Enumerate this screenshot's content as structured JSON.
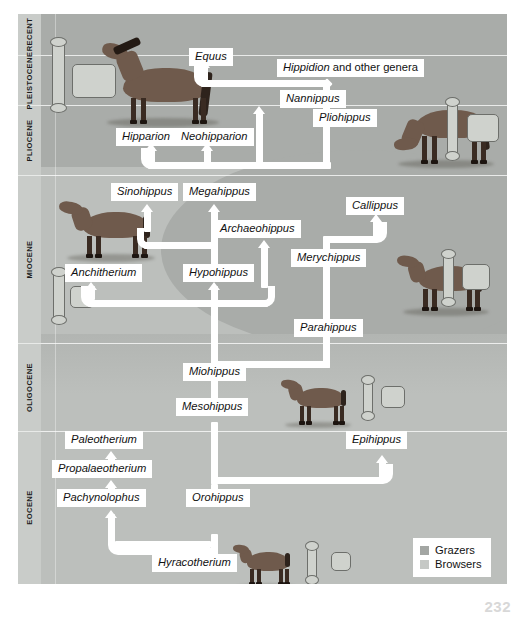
{
  "figure": {
    "kind": "horse-evolution-phylogeny-chart",
    "page_number": "232"
  },
  "epochs": [
    {
      "name": "RECENT",
      "top": 0,
      "height": 41
    },
    {
      "name": "PLEISTOCENE",
      "top": 41,
      "height": 50
    },
    {
      "name": "PLIOCENE",
      "top": 91,
      "height": 70
    },
    {
      "name": "MIOCENE",
      "top": 161,
      "height": 168
    },
    {
      "name": "OLIGOCENE",
      "top": 329,
      "height": 88
    },
    {
      "name": "EOCENE",
      "top": 417,
      "height": 153
    }
  ],
  "taxa": [
    {
      "id": "equus",
      "label": "Equus",
      "x": 148,
      "y": 44,
      "italic": true
    },
    {
      "id": "hippidion",
      "label": "Hippidion",
      "suffix": " and other genera",
      "x": 236,
      "y": 55,
      "italic": true
    },
    {
      "id": "nannippus",
      "label": "Nannippus",
      "x": 239,
      "y": 86,
      "italic": true
    },
    {
      "id": "pliohippus",
      "label": "Pliohippus",
      "x": 272,
      "y": 105,
      "italic": true
    },
    {
      "id": "hipparion",
      "label": "Hipparion",
      "x": 139,
      "y": 124,
      "italic": true
    },
    {
      "id": "neohipparion",
      "label": "Neohipparion",
      "x": 191,
      "y": 124,
      "italic": true
    },
    {
      "id": "sinohippus",
      "label": "Sinohippus",
      "x": 78,
      "y": 179,
      "italic": true
    },
    {
      "id": "megahippus",
      "label": "Megahippus",
      "x": 155,
      "y": 179,
      "italic": true
    },
    {
      "id": "archaeohippus",
      "label": "Archaeohippus",
      "x": 190,
      "y": 217,
      "italic": true
    },
    {
      "id": "callippus",
      "label": "Callippus",
      "x": 330,
      "y": 192,
      "italic": true
    },
    {
      "id": "merychippus",
      "label": "Merychippus",
      "x": 269,
      "y": 246,
      "italic": true
    },
    {
      "id": "anchitherium",
      "label": "Anchitherium",
      "x": 32,
      "y": 260,
      "italic": true
    },
    {
      "id": "hypohippus",
      "label": "Hypohippus",
      "x": 155,
      "y": 260,
      "italic": true
    },
    {
      "id": "parahippus",
      "label": "Parahippus",
      "x": 272,
      "y": 315,
      "italic": true
    },
    {
      "id": "miohippus",
      "label": "Miohippus",
      "x": 155,
      "y": 360,
      "italic": true
    },
    {
      "id": "mesohippus",
      "label": "Mesohippus",
      "x": 148,
      "y": 395,
      "italic": true
    },
    {
      "id": "paleotherium",
      "label": "Paleotherium",
      "x": 68,
      "y": 428,
      "italic": true
    },
    {
      "id": "propalaeotherium",
      "label": "Propalaeotherium",
      "x": 55,
      "y": 457,
      "italic": true
    },
    {
      "id": "pachynolophus",
      "label": "Pachynolophus",
      "x": 59,
      "y": 486,
      "italic": true
    },
    {
      "id": "orohippus",
      "label": "Orohippus",
      "x": 165,
      "y": 486,
      "italic": true
    },
    {
      "id": "epihippus",
      "label": "Epihippus",
      "x": 325,
      "y": 428,
      "italic": true
    },
    {
      "id": "hyracotherium",
      "label": "Hyracotherium",
      "x": 128,
      "y": 551,
      "italic": true
    }
  ],
  "legend": {
    "items": [
      {
        "label": "Grazers",
        "color": "#a3a6a3"
      },
      {
        "label": "Browsers",
        "color": "#c5c8c5"
      }
    ]
  },
  "art": {
    "horse_equus": "equus-horse-illustration",
    "horse_pliohippus": "pliohippus-horse-illustration",
    "horse_anchitherium": "anchitherium-horse-illustration",
    "horse_merychippus": "merychippus-horse-illustration",
    "horse_mesohippus": "mesohippus-horse-illustration",
    "horse_hyracotherium": "hyracotherium-horse-illustration",
    "bone": "limb-bone-fossil",
    "tooth": "molar-tooth-fossil"
  }
}
